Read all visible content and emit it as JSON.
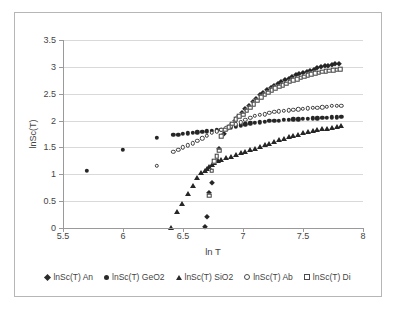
{
  "chart_data": {
    "type": "scatter",
    "title": "",
    "xlabel": "ln T",
    "ylabel": "lnSc(T)",
    "xlim": [
      5.5,
      8
    ],
    "ylim": [
      0,
      3.5
    ],
    "xticks": [
      "5.5",
      "6",
      "6.5",
      "7",
      "7.5",
      "8"
    ],
    "xtick_values": [
      5.5,
      6,
      6.5,
      7,
      7.5,
      8
    ],
    "yticks": [
      "0",
      "0.5",
      "1",
      "1.5",
      "2",
      "2.5",
      "3",
      "3.5"
    ],
    "ytick_values": [
      0,
      0.5,
      1,
      1.5,
      2,
      2.5,
      3,
      3.5
    ],
    "grid": "horizontal",
    "legend_position": "bottom",
    "series": [
      {
        "name": "lnSc(T) An",
        "marker": "filled-diamond",
        "color": "#262626",
        "points": [
          [
            6.68,
            0.02
          ],
          [
            6.7,
            0.2
          ],
          [
            6.72,
            0.65
          ],
          [
            6.74,
            0.83
          ],
          [
            6.8,
            1.48
          ],
          [
            6.84,
            1.75
          ],
          [
            6.87,
            1.84
          ],
          [
            6.9,
            1.92
          ],
          [
            6.93,
            2.0
          ],
          [
            6.96,
            2.07
          ],
          [
            6.99,
            2.14
          ],
          [
            7.02,
            2.21
          ],
          [
            7.05,
            2.28
          ],
          [
            7.08,
            2.35
          ],
          [
            7.11,
            2.41
          ],
          [
            7.14,
            2.47
          ],
          [
            7.17,
            2.52
          ],
          [
            7.2,
            2.56
          ],
          [
            7.23,
            2.6
          ],
          [
            7.26,
            2.64
          ],
          [
            7.29,
            2.68
          ],
          [
            7.32,
            2.71
          ],
          [
            7.35,
            2.75
          ],
          [
            7.38,
            2.78
          ],
          [
            7.41,
            2.81
          ],
          [
            7.44,
            2.84
          ],
          [
            7.47,
            2.86
          ],
          [
            7.5,
            2.89
          ],
          [
            7.53,
            2.91
          ],
          [
            7.56,
            2.93
          ],
          [
            7.59,
            2.95
          ],
          [
            7.62,
            2.97
          ],
          [
            7.65,
            2.99
          ],
          [
            7.68,
            3.01
          ],
          [
            7.71,
            3.02
          ],
          [
            7.74,
            3.04
          ],
          [
            7.77,
            3.05
          ],
          [
            7.8,
            3.06
          ]
        ]
      },
      {
        "name": "lnSc(T) GeO2",
        "marker": "filled-circle",
        "color": "#262626",
        "points": [
          [
            5.7,
            1.06
          ],
          [
            6.0,
            1.46
          ],
          [
            6.28,
            1.68
          ],
          [
            6.42,
            1.73
          ],
          [
            6.46,
            1.74
          ],
          [
            6.5,
            1.75
          ],
          [
            6.54,
            1.76
          ],
          [
            6.58,
            1.77
          ],
          [
            6.62,
            1.78
          ],
          [
            6.66,
            1.79
          ],
          [
            6.7,
            1.8
          ],
          [
            6.74,
            1.81
          ],
          [
            6.78,
            1.82
          ],
          [
            6.82,
            1.83
          ],
          [
            6.86,
            1.85
          ],
          [
            6.9,
            1.87
          ],
          [
            6.94,
            1.89
          ],
          [
            6.98,
            1.91
          ],
          [
            7.02,
            1.93
          ],
          [
            7.06,
            1.95
          ],
          [
            7.1,
            1.96
          ],
          [
            7.14,
            1.97
          ],
          [
            7.18,
            1.98
          ],
          [
            7.22,
            1.99
          ],
          [
            7.26,
            2.0
          ],
          [
            7.3,
            2.0
          ],
          [
            7.34,
            2.01
          ],
          [
            7.38,
            2.01
          ],
          [
            7.42,
            2.02
          ],
          [
            7.46,
            2.02
          ],
          [
            7.5,
            2.03
          ],
          [
            7.54,
            2.03
          ],
          [
            7.58,
            2.04
          ],
          [
            7.62,
            2.04
          ],
          [
            7.66,
            2.05
          ],
          [
            7.7,
            2.05
          ],
          [
            7.74,
            2.06
          ],
          [
            7.78,
            2.06
          ],
          [
            7.82,
            2.07
          ]
        ]
      },
      {
        "name": "lnSc(T) SiO2",
        "marker": "filled-triangle",
        "color": "#262626",
        "points": [
          [
            6.4,
            0.0
          ],
          [
            6.45,
            0.3
          ],
          [
            6.49,
            0.45
          ],
          [
            6.54,
            0.64
          ],
          [
            6.58,
            0.79
          ],
          [
            6.62,
            0.94
          ],
          [
            6.65,
            1.02
          ],
          [
            6.68,
            1.06
          ],
          [
            6.7,
            1.1
          ],
          [
            6.72,
            1.14
          ],
          [
            6.74,
            1.18
          ],
          [
            6.76,
            1.21
          ],
          [
            6.79,
            1.25
          ],
          [
            6.82,
            1.26
          ],
          [
            6.86,
            1.3
          ],
          [
            6.9,
            1.33
          ],
          [
            6.94,
            1.36
          ],
          [
            6.98,
            1.39
          ],
          [
            7.02,
            1.42
          ],
          [
            7.06,
            1.45
          ],
          [
            7.1,
            1.48
          ],
          [
            7.14,
            1.51
          ],
          [
            7.18,
            1.54
          ],
          [
            7.22,
            1.57
          ],
          [
            7.26,
            1.6
          ],
          [
            7.3,
            1.63
          ],
          [
            7.34,
            1.66
          ],
          [
            7.38,
            1.69
          ],
          [
            7.42,
            1.71
          ],
          [
            7.46,
            1.74
          ],
          [
            7.5,
            1.76
          ],
          [
            7.54,
            1.78
          ],
          [
            7.58,
            1.8
          ],
          [
            7.62,
            1.82
          ],
          [
            7.66,
            1.84
          ],
          [
            7.7,
            1.85
          ],
          [
            7.74,
            1.87
          ],
          [
            7.78,
            1.88
          ],
          [
            7.82,
            1.9
          ]
        ]
      },
      {
        "name": "lnSc(T) Ab",
        "marker": "open-circle",
        "color": "#3d3d3d",
        "points": [
          [
            6.28,
            1.16
          ],
          [
            6.42,
            1.42
          ],
          [
            6.46,
            1.46
          ],
          [
            6.5,
            1.5
          ],
          [
            6.54,
            1.54
          ],
          [
            6.58,
            1.58
          ],
          [
            6.62,
            1.62
          ],
          [
            6.66,
            1.67
          ],
          [
            6.7,
            1.72
          ],
          [
            6.74,
            1.77
          ],
          [
            6.78,
            1.8
          ],
          [
            6.82,
            1.83
          ],
          [
            6.86,
            1.86
          ],
          [
            6.9,
            1.89
          ],
          [
            6.94,
            1.93
          ],
          [
            6.98,
            1.97
          ],
          [
            7.02,
            2.01
          ],
          [
            7.06,
            2.05
          ],
          [
            7.1,
            2.09
          ],
          [
            7.14,
            2.11
          ],
          [
            7.18,
            2.12
          ],
          [
            7.22,
            2.14
          ],
          [
            7.26,
            2.16
          ],
          [
            7.3,
            2.17
          ],
          [
            7.34,
            2.18
          ],
          [
            7.38,
            2.19
          ],
          [
            7.42,
            2.2
          ],
          [
            7.46,
            2.21
          ],
          [
            7.5,
            2.22
          ],
          [
            7.54,
            2.23
          ],
          [
            7.58,
            2.24
          ],
          [
            7.62,
            2.24
          ],
          [
            7.66,
            2.25
          ],
          [
            7.7,
            2.26
          ],
          [
            7.74,
            2.27
          ],
          [
            7.78,
            2.27
          ],
          [
            7.82,
            2.28
          ]
        ]
      },
      {
        "name": "lnSc(T) Di",
        "marker": "open-square",
        "color": "#3d3d3d",
        "points": [
          [
            6.72,
            0.6
          ],
          [
            6.74,
            1.07
          ],
          [
            6.76,
            1.24
          ],
          [
            6.78,
            1.34
          ],
          [
            6.8,
            1.44
          ],
          [
            6.82,
            1.71
          ],
          [
            6.85,
            1.83
          ],
          [
            6.88,
            1.88
          ],
          [
            6.91,
            1.94
          ],
          [
            6.94,
            2.03
          ],
          [
            6.97,
            2.08
          ],
          [
            7.0,
            2.11
          ],
          [
            7.03,
            2.18
          ],
          [
            7.06,
            2.24
          ],
          [
            7.09,
            2.31
          ],
          [
            7.12,
            2.37
          ],
          [
            7.15,
            2.43
          ],
          [
            7.18,
            2.48
          ],
          [
            7.21,
            2.52
          ],
          [
            7.24,
            2.56
          ],
          [
            7.27,
            2.6
          ],
          [
            7.3,
            2.63
          ],
          [
            7.33,
            2.66
          ],
          [
            7.36,
            2.69
          ],
          [
            7.39,
            2.72
          ],
          [
            7.42,
            2.75
          ],
          [
            7.45,
            2.77
          ],
          [
            7.48,
            2.8
          ],
          [
            7.51,
            2.82
          ],
          [
            7.54,
            2.84
          ],
          [
            7.57,
            2.86
          ],
          [
            7.6,
            2.88
          ],
          [
            7.63,
            2.89
          ],
          [
            7.66,
            2.91
          ],
          [
            7.69,
            2.92
          ],
          [
            7.72,
            2.93
          ],
          [
            7.75,
            2.94
          ],
          [
            7.78,
            2.95
          ],
          [
            7.81,
            2.96
          ]
        ]
      }
    ]
  }
}
